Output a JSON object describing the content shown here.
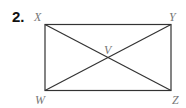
{
  "problem": {
    "number": "2."
  },
  "diagram": {
    "shape": "rectangle with diagonals",
    "vertices": {
      "top_left": "X",
      "top_right": "Y",
      "bottom_left": "W",
      "bottom_right": "Z"
    },
    "intersection": "V",
    "line_color": "#333333",
    "label_color": "#777777"
  }
}
